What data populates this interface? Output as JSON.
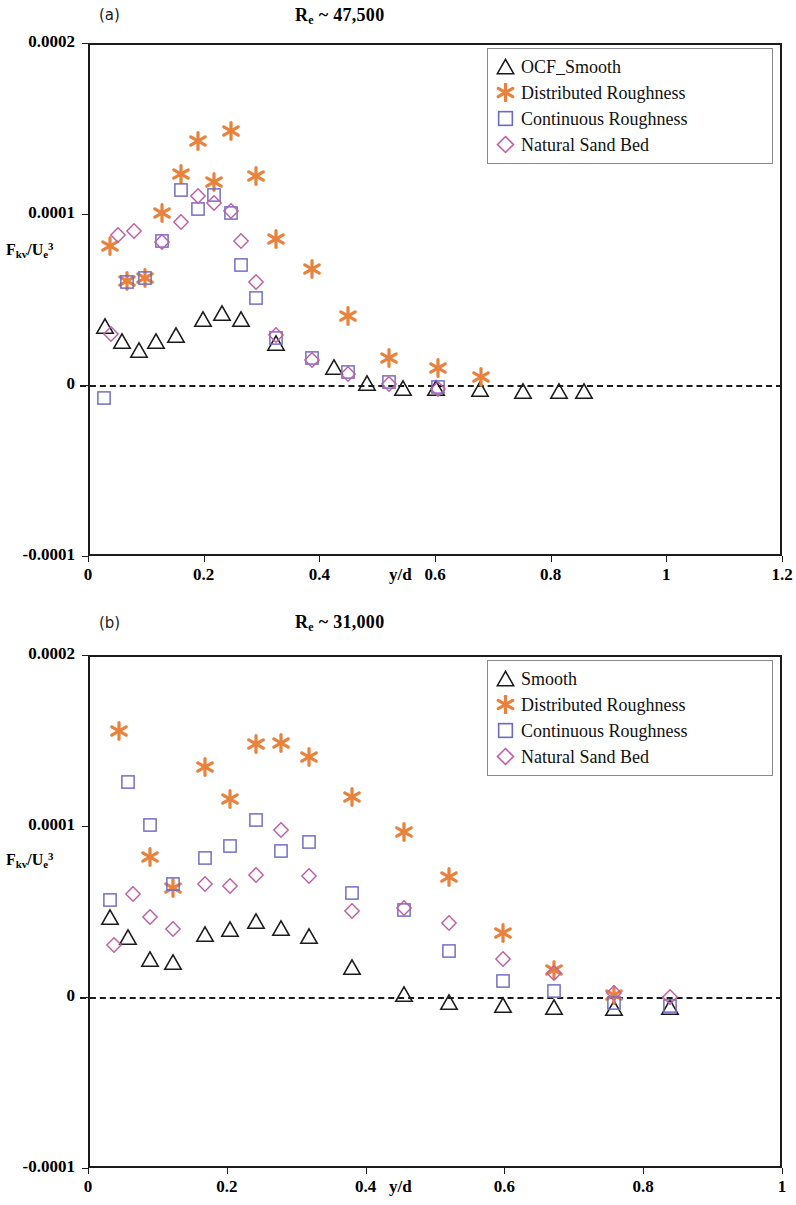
{
  "figure": {
    "width": 796,
    "height": 1205,
    "background": "#ffffff"
  },
  "colors": {
    "smooth": "#1b1b1b",
    "distributed_roughness": "#E8823C",
    "continuous_roughness": "#6B6BC6",
    "natural_sand_bed": "#C05FA8",
    "axis": "#1b1b1b",
    "legend_border": "#8a8a8a"
  },
  "panels": [
    {
      "id": "a",
      "tag": "(a)",
      "title_main": "R",
      "title_sub": "e",
      "title_rest": " ~ 47,500",
      "title_plain": "Re ~ 47,500",
      "ylabel_parts": {
        "main": "F",
        "sub1": "kv",
        "mid": "/U",
        "sub2": "e",
        "sup": "3"
      },
      "ylabel_plain": "Fkv/Ue3",
      "xlabel": "y/d",
      "yticks": [
        "0.0002",
        "0.0001",
        "0",
        "-0.0001"
      ],
      "ytick_values": [
        0.0002,
        0.0001,
        0,
        -0.0001
      ],
      "xticks": [
        "0",
        "0.2",
        "0.4",
        "0.6",
        "0.8",
        "1",
        "1.2"
      ],
      "xtick_values": [
        0,
        0.2,
        0.4,
        0.6,
        0.8,
        1,
        1.2
      ],
      "legend": [
        {
          "label": "OCF_Smooth",
          "marker": "triangle",
          "color": "#1b1b1b"
        },
        {
          "label": "Distributed Roughness",
          "marker": "asterisk",
          "color": "#E8823C"
        },
        {
          "label": "Continuous Roughness",
          "marker": "square",
          "color": "#6B6BC6"
        },
        {
          "label": "Natural Sand Bed",
          "marker": "diamond",
          "color": "#C05FA8"
        }
      ]
    },
    {
      "id": "b",
      "tag": "(b)",
      "title_main": "R",
      "title_sub": "e",
      "title_rest": " ~ 31,000",
      "title_plain": "Re ~ 31,000",
      "ylabel_parts": {
        "main": "F",
        "sub1": "kv",
        "mid": "/U",
        "sub2": "e",
        "sup": "3"
      },
      "ylabel_plain": "Fkv/Ue3",
      "xlabel": "y/d",
      "yticks": [
        "0.0002",
        "0.0001",
        "0",
        "-0.0001"
      ],
      "ytick_values": [
        0.0002,
        0.0001,
        0,
        -0.0001
      ],
      "xticks": [
        "0",
        "0.2",
        "0.4",
        "0.6",
        "0.8",
        "1"
      ],
      "xtick_values": [
        0,
        0.2,
        0.4,
        0.6,
        0.8,
        1
      ],
      "legend": [
        {
          "label": "Smooth",
          "marker": "triangle",
          "color": "#1b1b1b"
        },
        {
          "label": "Distributed Roughness",
          "marker": "asterisk",
          "color": "#E8823C"
        },
        {
          "label": "Continuous Roughness",
          "marker": "square",
          "color": "#6B6BC6"
        },
        {
          "label": "Natural Sand Bed",
          "marker": "diamond",
          "color": "#C05FA8"
        }
      ]
    }
  ],
  "chart_data": [
    {
      "type": "scatter",
      "panel": "a",
      "title": "Re ~ 47,500",
      "xlabel": "y/d",
      "ylabel": "Fkv/Ue^3",
      "xlim": [
        0,
        1.2
      ],
      "ylim": [
        -0.0001,
        0.0002
      ],
      "grid": false,
      "legend_position": "top-right",
      "annotations": [
        "(a)",
        "zero reference dashed line at y = 0"
      ],
      "series": [
        {
          "name": "OCF_Smooth",
          "marker": "triangle",
          "color": "#1b1b1b",
          "points": [
            [
              0.03,
              3.45e-05
            ],
            [
              0.058,
              2.55e-05
            ],
            [
              0.088,
              2.05e-05
            ],
            [
              0.118,
              2.55e-05
            ],
            [
              0.152,
              2.9e-05
            ],
            [
              0.198,
              3.85e-05
            ],
            [
              0.232,
              4.2e-05
            ],
            [
              0.265,
              3.85e-05
            ],
            [
              0.325,
              2.45e-05
            ],
            [
              0.425,
              1.05e-05
            ],
            [
              0.482,
              1e-06
            ],
            [
              0.545,
              -2e-06
            ],
            [
              0.602,
              -2e-06
            ],
            [
              0.678,
              -2.5e-06
            ],
            [
              0.752,
              -3.5e-06
            ],
            [
              0.815,
              -3.5e-06
            ],
            [
              0.858,
              -3.5e-06
            ]
          ]
        },
        {
          "name": "Distributed Roughness",
          "marker": "asterisk",
          "color": "#E8823C",
          "points": [
            [
              0.038,
              8.15e-05
            ],
            [
              0.068,
              6.1e-05
            ],
            [
              0.098,
              6.25e-05
            ],
            [
              0.128,
              0.0001005
            ],
            [
              0.16,
              0.0001235
            ],
            [
              0.19,
              0.0001425
            ],
            [
              0.218,
              0.0001185
            ],
            [
              0.248,
              0.0001485
            ],
            [
              0.29,
              0.0001225
            ],
            [
              0.325,
              8.55e-05
            ],
            [
              0.388,
              6.8e-05
            ],
            [
              0.45,
              4.05e-05
            ],
            [
              0.52,
              1.6e-05
            ],
            [
              0.605,
              1e-05
            ],
            [
              0.68,
              4.5e-06
            ]
          ]
        },
        {
          "name": "Continuous Roughness",
          "marker": "square",
          "color": "#6B6BC6",
          "points": [
            [
              0.028,
              -7.5e-06
            ],
            [
              0.068,
              6.05e-05
            ],
            [
              0.098,
              6.25e-05
            ],
            [
              0.128,
              8.4e-05
            ],
            [
              0.16,
              0.000114
            ],
            [
              0.19,
              0.000103
            ],
            [
              0.218,
              0.000111
            ],
            [
              0.248,
              0.0001005
            ],
            [
              0.265,
              7e-05
            ],
            [
              0.29,
              5.1e-05
            ],
            [
              0.325,
              2.75e-05
            ],
            [
              0.388,
              1.55e-05
            ],
            [
              0.45,
              7.5e-06
            ],
            [
              0.52,
              1.5e-06
            ],
            [
              0.605,
              -1e-06
            ]
          ]
        },
        {
          "name": "Natural Sand Bed",
          "marker": "diamond",
          "color": "#C05FA8",
          "points": [
            [
              0.04,
              3e-05
            ],
            [
              0.052,
              8.8e-05
            ],
            [
              0.08,
              9e-05
            ],
            [
              0.128,
              8.35e-05
            ],
            [
              0.16,
              9.55e-05
            ],
            [
              0.19,
              0.0001105
            ],
            [
              0.218,
              0.0001065
            ],
            [
              0.248,
              0.0001015
            ],
            [
              0.265,
              8.4e-05
            ],
            [
              0.29,
              6.05e-05
            ],
            [
              0.325,
              2.9e-05
            ],
            [
              0.388,
              1.45e-05
            ],
            [
              0.45,
              6.5e-06
            ],
            [
              0.52,
              5e-07
            ],
            [
              0.605,
              -2.5e-06
            ]
          ]
        }
      ]
    },
    {
      "type": "scatter",
      "panel": "b",
      "title": "Re ~ 31,000",
      "xlabel": "y/d",
      "ylabel": "Fkv/Ue^3",
      "xlim": [
        0,
        1.0
      ],
      "ylim": [
        -0.0001,
        0.0002
      ],
      "grid": false,
      "legend_position": "top-right",
      "annotations": [
        "(b)",
        "zero reference dashed line at y = 0"
      ],
      "series": [
        {
          "name": "Smooth",
          "marker": "triangle",
          "color": "#1b1b1b",
          "points": [
            [
              0.032,
              4.7e-05
            ],
            [
              0.058,
              3.5e-05
            ],
            [
              0.09,
              2.25e-05
            ],
            [
              0.122,
              2.05e-05
            ],
            [
              0.168,
              3.7e-05
            ],
            [
              0.205,
              4e-05
            ],
            [
              0.242,
              4.45e-05
            ],
            [
              0.278,
              4.05e-05
            ],
            [
              0.318,
              3.55e-05
            ],
            [
              0.38,
              1.75e-05
            ],
            [
              0.455,
              1.5e-06
            ],
            [
              0.52,
              -3e-06
            ],
            [
              0.598,
              -4.5e-06
            ],
            [
              0.672,
              -6e-06
            ],
            [
              0.758,
              -6.5e-06
            ],
            [
              0.838,
              -6e-06
            ]
          ]
        },
        {
          "name": "Distributed Roughness",
          "marker": "asterisk",
          "color": "#E8823C",
          "points": [
            [
              0.045,
              0.0001555
            ],
            [
              0.09,
              8.2e-05
            ],
            [
              0.122,
              6.4e-05
            ],
            [
              0.168,
              0.0001345
            ],
            [
              0.205,
              0.0001155
            ],
            [
              0.242,
              0.000148
            ],
            [
              0.278,
              0.0001485
            ],
            [
              0.318,
              0.0001405
            ],
            [
              0.38,
              0.000117
            ],
            [
              0.455,
              9.65e-05
            ],
            [
              0.52,
              7e-05
            ],
            [
              0.598,
              3.75e-05
            ],
            [
              0.672,
              1.6e-05
            ],
            [
              0.758,
              1e-06
            ]
          ]
        },
        {
          "name": "Continuous Roughness",
          "marker": "square",
          "color": "#6B6BC6",
          "points": [
            [
              0.032,
              5.7e-05
            ],
            [
              0.058,
              0.0001255
            ],
            [
              0.09,
              0.0001005
            ],
            [
              0.122,
              6.6e-05
            ],
            [
              0.168,
              8.15e-05
            ],
            [
              0.205,
              8.85e-05
            ],
            [
              0.242,
              0.0001035
            ],
            [
              0.278,
              8.55e-05
            ],
            [
              0.318,
              9.05e-05
            ],
            [
              0.38,
              6.1e-05
            ],
            [
              0.455,
              5.1e-05
            ],
            [
              0.52,
              2.7e-05
            ],
            [
              0.598,
              9.5e-06
            ],
            [
              0.672,
              3.5e-06
            ],
            [
              0.758,
              -3.5e-06
            ],
            [
              0.838,
              -5e-06
            ]
          ]
        },
        {
          "name": "Natural Sand Bed",
          "marker": "diamond",
          "color": "#C05FA8",
          "points": [
            [
              0.038,
              3.05e-05
            ],
            [
              0.065,
              6e-05
            ],
            [
              0.09,
              4.7e-05
            ],
            [
              0.122,
              4e-05
            ],
            [
              0.168,
              6.6e-05
            ],
            [
              0.205,
              6.5e-05
            ],
            [
              0.242,
              7.15e-05
            ],
            [
              0.278,
              9.75e-05
            ],
            [
              0.318,
              7.05e-05
            ],
            [
              0.38,
              5.05e-05
            ],
            [
              0.455,
              5.2e-05
            ],
            [
              0.52,
              4.3e-05
            ],
            [
              0.598,
              2.25e-05
            ],
            [
              0.672,
              1.4e-05
            ],
            [
              0.758,
              2.5e-06
            ],
            [
              0.838,
              0.0
            ]
          ]
        }
      ]
    }
  ]
}
